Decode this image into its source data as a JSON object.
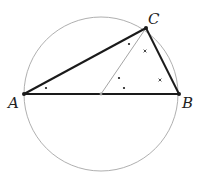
{
  "diagram": {
    "type": "geometry",
    "colors": {
      "circle": "#9a9a9a",
      "triangle": "#1a1a1a",
      "median": "#9a9a9a",
      "marks": "#1a1a1a"
    },
    "circle": {
      "cx": 101,
      "cy": 94,
      "r": 77
    },
    "points": {
      "A": {
        "x": 24,
        "y": 94,
        "label": "A"
      },
      "B": {
        "x": 179,
        "y": 94,
        "label": "B"
      },
      "C": {
        "x": 146,
        "y": 28,
        "label": "C"
      },
      "O": {
        "x": 101,
        "y": 94
      }
    },
    "labels": {
      "A": "A",
      "B": "B",
      "C": "C"
    },
    "angle_marks": {
      "dots": [
        {
          "x": 46,
          "y": 88
        },
        {
          "x": 129,
          "y": 44
        },
        {
          "x": 119,
          "y": 78
        },
        {
          "x": 124,
          "y": 88
        }
      ],
      "crosses": [
        {
          "x": 145,
          "y": 51
        },
        {
          "x": 160,
          "y": 80
        }
      ]
    }
  }
}
